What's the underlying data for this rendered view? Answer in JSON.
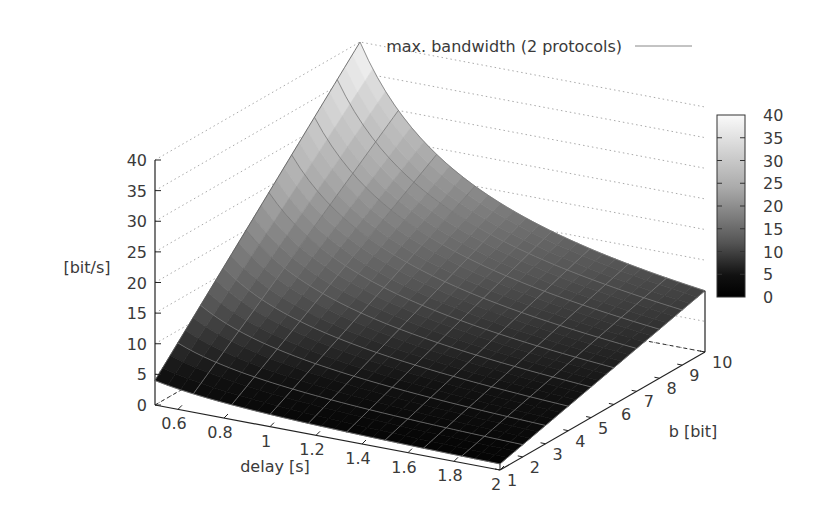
{
  "chart_data": {
    "type": "surface3d",
    "title": "",
    "legend": [
      {
        "label": "max. bandwidth (2 protocols)",
        "style": "line"
      }
    ],
    "xlabel": "delay [s]",
    "ylabel": "b [bit]",
    "zlabel": "[bit/s]",
    "x_ticks": [
      "0.6",
      "0.8",
      "1",
      "1.2",
      "1.4",
      "1.6",
      "1.8",
      "2"
    ],
    "y_ticks": [
      "1",
      "2",
      "3",
      "4",
      "5",
      "6",
      "7",
      "8",
      "9",
      "10"
    ],
    "z_ticks": [
      "0",
      "5",
      "10",
      "15",
      "20",
      "25",
      "30",
      "35",
      "40"
    ],
    "xlim": [
      0.5,
      2
    ],
    "ylim": [
      1,
      10
    ],
    "zlim": [
      0,
      40
    ],
    "colorbar": {
      "ticks": [
        "0",
        "5",
        "10",
        "15",
        "20",
        "25",
        "30",
        "35",
        "40"
      ],
      "range": [
        0,
        40
      ],
      "palette": "gray"
    },
    "function": "z = 2 * b / delay",
    "x": [
      0.5,
      0.6667,
      0.8333,
      1.0,
      1.1667,
      1.3333,
      1.5,
      1.6667,
      1.8333,
      2.0
    ],
    "y": [
      1,
      2,
      3,
      4,
      5,
      6,
      7,
      8,
      9,
      10
    ],
    "corner_values": {
      "delay0.5_b1": 4,
      "delay0.5_b10": 40,
      "delay2_b1": 1,
      "delay2_b10": 10
    }
  }
}
